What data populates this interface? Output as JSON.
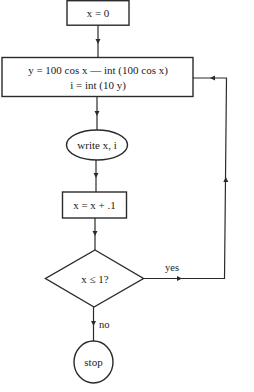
{
  "diagram": {
    "type": "flowchart",
    "nodes": [
      {
        "id": "init",
        "shape": "rectangle",
        "lines": [
          "x = 0"
        ]
      },
      {
        "id": "compute",
        "shape": "rectangle",
        "lines": [
          "y = 100 cos x — int (100 cos x)",
          "i = int (10 y)"
        ]
      },
      {
        "id": "output",
        "shape": "ellipse",
        "lines": [
          "write x, i"
        ]
      },
      {
        "id": "increment",
        "shape": "rectangle",
        "lines": [
          "x = x + .1"
        ]
      },
      {
        "id": "decision",
        "shape": "diamond",
        "lines": [
          "x ≤ 1?"
        ]
      },
      {
        "id": "end",
        "shape": "circle",
        "lines": [
          "stop"
        ]
      }
    ],
    "edges": [
      {
        "from": "init",
        "to": "compute",
        "label": ""
      },
      {
        "from": "compute",
        "to": "output",
        "label": ""
      },
      {
        "from": "output",
        "to": "increment",
        "label": ""
      },
      {
        "from": "increment",
        "to": "decision",
        "label": ""
      },
      {
        "from": "decision",
        "to": "compute",
        "label": "yes"
      },
      {
        "from": "decision",
        "to": "end",
        "label": "no"
      }
    ]
  },
  "labels": {
    "init": "x = 0",
    "compute_line1": "y = 100 cos x — int (100 cos x)",
    "compute_line2": "i = int (10 y)",
    "output": "write x, i",
    "increment": "x = x + .1",
    "decision": "x ≤ 1?",
    "end": "stop",
    "yes": "yes",
    "no": "no"
  }
}
